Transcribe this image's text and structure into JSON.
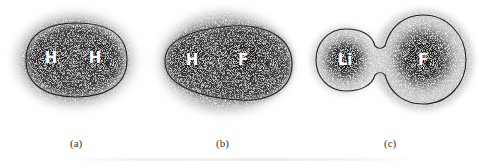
{
  "figure": {
    "panels": [
      {
        "id": "a",
        "caption": "(a)",
        "atoms": [
          "H",
          "H"
        ],
        "molecule": "H2"
      },
      {
        "id": "b",
        "caption": "(b)",
        "atoms": [
          "H",
          "F"
        ],
        "molecule": "HF"
      },
      {
        "id": "c",
        "caption": "(c)",
        "atoms": [
          "Li",
          "F"
        ],
        "molecule": "LiF"
      }
    ],
    "colors": {
      "density_dark": "#1a1a1a",
      "halo": "#9a9a9a",
      "contour": "#222222",
      "label": "#ffffff",
      "background": "#ffffff"
    }
  }
}
